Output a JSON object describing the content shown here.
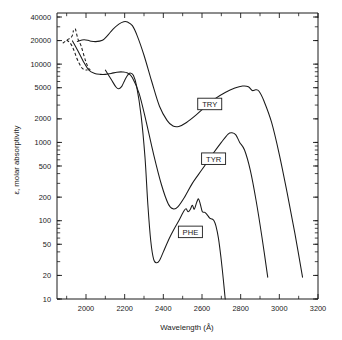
{
  "chart_data": {
    "type": "line",
    "title": "",
    "xlabel": "Wavelength (Å)",
    "ylabel": "ε, molar absorptivity",
    "xscale": "linear",
    "yscale": "log",
    "xlim": [
      1850,
      3200
    ],
    "ylim": [
      10,
      45000
    ],
    "grid": false,
    "legend_position": "inline-labels",
    "xticks": [
      2000,
      2200,
      2400,
      2600,
      2800,
      3000,
      3200
    ],
    "xtick_labels": [
      "2000",
      "2200",
      "2400",
      "2600",
      "2800",
      "3000",
      "3200"
    ],
    "xminor_ticks": [
      1900,
      2100,
      2300,
      2500,
      2700,
      2900,
      3100
    ],
    "yticks": [
      10,
      20,
      50,
      100,
      200,
      500,
      1000,
      2000,
      5000,
      10000,
      20000,
      40000
    ],
    "ytick_labels": [
      "10",
      "20",
      "50",
      "100",
      "200",
      "500",
      "1000",
      "2000",
      "5000",
      "10000",
      "20000",
      "40000"
    ],
    "series": [
      {
        "name": "TRY",
        "label": "TRY",
        "label_x": 2640,
        "label_y": 3100,
        "style": "solid",
        "points": [
          [
            1955,
            19500
          ],
          [
            1990,
            20500
          ],
          [
            2020,
            19800
          ],
          [
            2050,
            19400
          ],
          [
            2085,
            20200
          ],
          [
            2110,
            23000
          ],
          [
            2140,
            28000
          ],
          [
            2170,
            32500
          ],
          [
            2195,
            34800
          ],
          [
            2215,
            34500
          ],
          [
            2240,
            31000
          ],
          [
            2265,
            23000
          ],
          [
            2300,
            13000
          ],
          [
            2340,
            6000
          ],
          [
            2380,
            2900
          ],
          [
            2420,
            1900
          ],
          [
            2450,
            1620
          ],
          [
            2480,
            1600
          ],
          [
            2520,
            1800
          ],
          [
            2570,
            2250
          ],
          [
            2620,
            2900
          ],
          [
            2670,
            3650
          ],
          [
            2720,
            4350
          ],
          [
            2770,
            4950
          ],
          [
            2810,
            5250
          ],
          [
            2840,
            5150
          ],
          [
            2860,
            4600
          ],
          [
            2878,
            4700
          ],
          [
            2895,
            4500
          ],
          [
            2920,
            3400
          ],
          [
            2960,
            1800
          ],
          [
            3000,
            700
          ],
          [
            3040,
            230
          ],
          [
            3080,
            70
          ],
          [
            3120,
            19
          ]
        ]
      },
      {
        "name": "TYR",
        "label": "TYR",
        "label_x": 2660,
        "label_y": 620,
        "style": "solid",
        "points": [
          [
            1930,
            19800
          ],
          [
            1960,
            14500
          ],
          [
            1985,
            11000
          ],
          [
            2015,
            8400
          ],
          [
            2045,
            7600
          ],
          [
            2075,
            7400
          ],
          [
            2100,
            7400
          ],
          [
            2130,
            7600
          ],
          [
            2160,
            7900
          ],
          [
            2190,
            7950
          ],
          [
            2215,
            7700
          ],
          [
            2240,
            6700
          ],
          [
            2275,
            4200
          ],
          [
            2310,
            1900
          ],
          [
            2350,
            700
          ],
          [
            2390,
            290
          ],
          [
            2425,
            165
          ],
          [
            2450,
            142
          ],
          [
            2475,
            150
          ],
          [
            2510,
            200
          ],
          [
            2550,
            300
          ],
          [
            2600,
            450
          ],
          [
            2650,
            680
          ],
          [
            2700,
            1000
          ],
          [
            2735,
            1280
          ],
          [
            2755,
            1330
          ],
          [
            2775,
            1250
          ],
          [
            2795,
            1000
          ],
          [
            2820,
            800
          ],
          [
            2850,
            440
          ],
          [
            2880,
            180
          ],
          [
            2910,
            62
          ],
          [
            2940,
            19
          ]
        ]
      },
      {
        "name": "PHE",
        "label": "PHE",
        "label_x": 2540,
        "label_y": 72,
        "style": "solid",
        "points": [
          [
            2100,
            8400
          ],
          [
            2130,
            6400
          ],
          [
            2155,
            5100
          ],
          [
            2170,
            4850
          ],
          [
            2185,
            5200
          ],
          [
            2200,
            6200
          ],
          [
            2215,
            7200
          ],
          [
            2228,
            7700
          ],
          [
            2245,
            7200
          ],
          [
            2262,
            5200
          ],
          [
            2285,
            2200
          ],
          [
            2305,
            650
          ],
          [
            2320,
            160
          ],
          [
            2335,
            55
          ],
          [
            2350,
            32
          ],
          [
            2365,
            29
          ],
          [
            2380,
            31
          ],
          [
            2400,
            40
          ],
          [
            2420,
            52
          ],
          [
            2440,
            66
          ],
          [
            2460,
            82
          ],
          [
            2480,
            100
          ],
          [
            2495,
            118
          ],
          [
            2508,
            135
          ],
          [
            2518,
            142
          ],
          [
            2528,
            130
          ],
          [
            2540,
            140
          ],
          [
            2550,
            158
          ],
          [
            2560,
            140
          ],
          [
            2572,
            170
          ],
          [
            2582,
            190
          ],
          [
            2592,
            160
          ],
          [
            2602,
            130
          ],
          [
            2615,
            128
          ],
          [
            2628,
            118
          ],
          [
            2640,
            108
          ],
          [
            2652,
            105
          ],
          [
            2662,
            100
          ],
          [
            2672,
            86
          ],
          [
            2685,
            60
          ],
          [
            2698,
            34
          ],
          [
            2710,
            18
          ],
          [
            2720,
            10
          ]
        ]
      },
      {
        "name": "TRY-extrapolated",
        "label": "",
        "style": "dashed",
        "points": [
          [
            1880,
            18500
          ],
          [
            1905,
            20600
          ],
          [
            1920,
            21500
          ],
          [
            1930,
            23500
          ],
          [
            1935,
            27000
          ]
        ]
      },
      {
        "name": "TYR-extrapolated-upper",
        "label": "",
        "style": "dashed",
        "points": [
          [
            1945,
            28500
          ],
          [
            1952,
            24000
          ],
          [
            1958,
            21000
          ],
          [
            1965,
            19400
          ],
          [
            1975,
            17000
          ],
          [
            1985,
            14000
          ],
          [
            1998,
            11000
          ],
          [
            2010,
            9200
          ],
          [
            2022,
            8400
          ]
        ]
      },
      {
        "name": "TYR-extrapolated-lower",
        "label": "",
        "style": "dashed",
        "points": [
          [
            1900,
            20300
          ],
          [
            1915,
            19000
          ],
          [
            1928,
            17000
          ],
          [
            1940,
            14500
          ],
          [
            1952,
            12000
          ],
          [
            1965,
            10200
          ],
          [
            1978,
            9000
          ],
          [
            1992,
            8500
          ],
          [
            2008,
            8400
          ]
        ]
      }
    ]
  },
  "axis": {
    "x_title": "Wavelength (Å)",
    "y_title": "ε, molar absorptivity"
  },
  "labels": {
    "try": "TRY",
    "tyr": "TYR",
    "phe": "PHE"
  },
  "colors": {
    "curve": "#1a1a1a",
    "axis": "#1a1a1a",
    "background": "#ffffff"
  }
}
